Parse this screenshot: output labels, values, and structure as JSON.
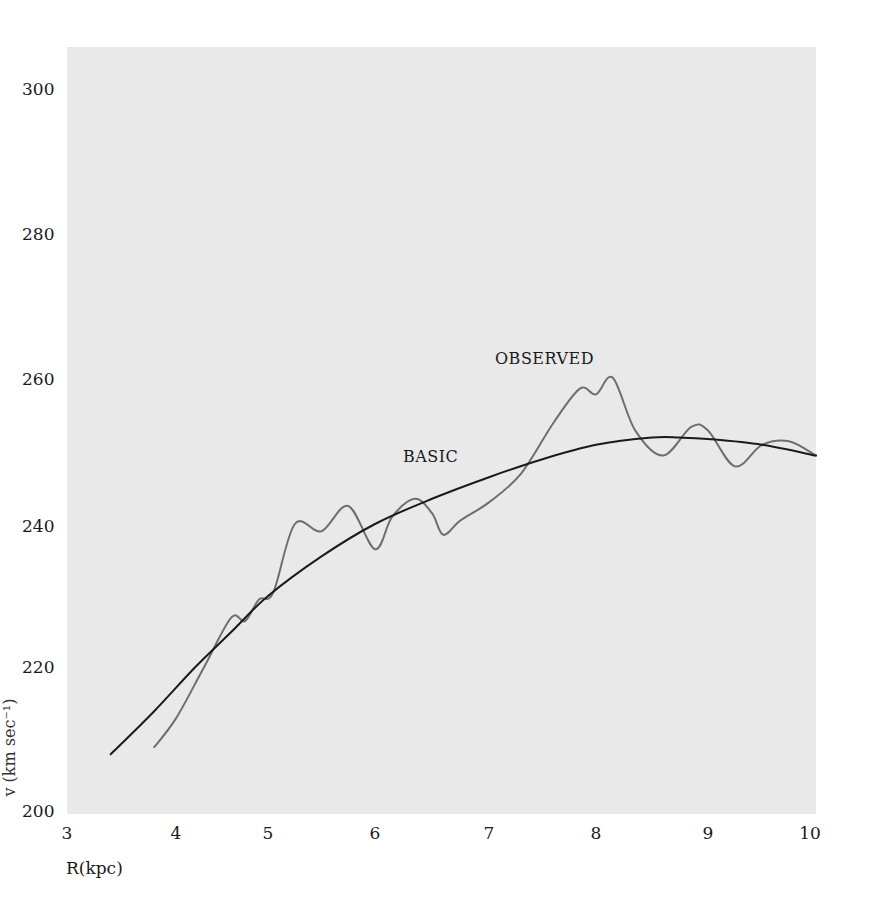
{
  "chart_data": {
    "type": "line",
    "title": "",
    "xlabel": "R(kpc)",
    "ylabel": "v (km sec⁻¹)",
    "xlim": [
      3,
      10
    ],
    "ylim": [
      200,
      305
    ],
    "x_ticks": [
      "3",
      "4",
      "5",
      "6",
      "7",
      "8",
      "9",
      "10"
    ],
    "y_ticks": [
      "200",
      "220",
      "240",
      "260",
      "280",
      "300"
    ],
    "grid": false,
    "legend": "inline labels",
    "series": [
      {
        "name": "BASIC",
        "color": "#1a1a1a",
        "x": [
          3.4,
          3.8,
          4.2,
          4.6,
          5.0,
          5.5,
          6.0,
          6.5,
          7.0,
          7.5,
          8.0,
          8.5,
          8.75,
          9.0,
          9.5,
          10.0
        ],
        "values": [
          208,
          214,
          220,
          225,
          230,
          235.5,
          240,
          243.5,
          246.5,
          249,
          251,
          252,
          252,
          251.8,
          251,
          249.5
        ]
      },
      {
        "name": "OBSERVED",
        "color": "#6e6e6e",
        "x": [
          3.8,
          4.0,
          4.3,
          4.6,
          4.75,
          4.9,
          5.05,
          5.25,
          5.5,
          5.75,
          6.0,
          6.15,
          6.35,
          6.5,
          6.6,
          6.75,
          7.0,
          7.3,
          7.6,
          7.85,
          8.0,
          8.15,
          8.35,
          8.6,
          8.85,
          9.0,
          9.25,
          9.5,
          9.75,
          10.0
        ],
        "values": [
          209,
          213,
          220,
          227,
          226.5,
          229.5,
          230.5,
          240,
          239,
          242.5,
          236.5,
          241,
          243.5,
          241.5,
          238.5,
          240.5,
          243,
          247,
          254,
          258.8,
          258,
          260.3,
          253,
          249.5,
          253.5,
          253,
          248,
          251,
          251.5,
          249.5
        ]
      }
    ],
    "annotations": [
      {
        "text": "BASIC",
        "x": 6.4,
        "y": 255
      },
      {
        "text": "OBSERVED",
        "x": 7.6,
        "y": 263
      }
    ]
  },
  "axes": {
    "xlabel": "R(kpc)",
    "ylabel_fragment": "v (km sec⁻¹)",
    "x_ticks": [
      "3",
      "4",
      "5",
      "6",
      "7",
      "8",
      "9",
      "10"
    ],
    "y_ticks": [
      "300",
      "280",
      "260",
      "240",
      "220",
      "200"
    ]
  },
  "labels": {
    "basic": "BASIC",
    "observed": "OBSERVED"
  }
}
